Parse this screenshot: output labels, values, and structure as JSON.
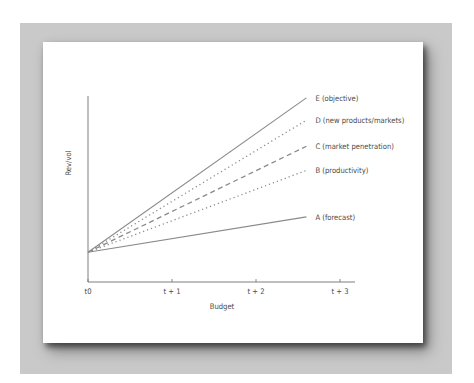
{
  "chart_data": {
    "type": "line",
    "title": "",
    "xlabel": "Budget",
    "ylabel": "Rev/vol",
    "xlim": [
      0,
      3
    ],
    "ylim": [
      0,
      1
    ],
    "x_ticks": [
      {
        "value": 0,
        "label": "t0"
      },
      {
        "value": 1,
        "label": "t + 1"
      },
      {
        "value": 2,
        "label": "t + 2"
      },
      {
        "value": 3,
        "label": "t + 3"
      }
    ],
    "grid": false,
    "legend": "inline-right",
    "series": [
      {
        "name": "E (objective)",
        "style": "solid",
        "x": [
          0,
          2.6
        ],
        "y": [
          0.16,
          0.99
        ]
      },
      {
        "name": "D (new products/markets)",
        "style": "dotted",
        "x": [
          0,
          2.6
        ],
        "y": [
          0.16,
          0.87
        ]
      },
      {
        "name": "C (market penetration)",
        "style": "dashed",
        "x": [
          0,
          2.6
        ],
        "y": [
          0.16,
          0.73
        ]
      },
      {
        "name": "B (productivity)",
        "style": "dotted",
        "x": [
          0,
          2.6
        ],
        "y": [
          0.16,
          0.6
        ]
      },
      {
        "name": "A (forecast)",
        "style": "solid",
        "x": [
          0,
          2.6
        ],
        "y": [
          0.16,
          0.35
        ]
      }
    ]
  },
  "colors": {
    "frame": "#c9c9c9",
    "line": "#8a8a8a",
    "axis": "#707070",
    "text": "#4a4a4a"
  }
}
